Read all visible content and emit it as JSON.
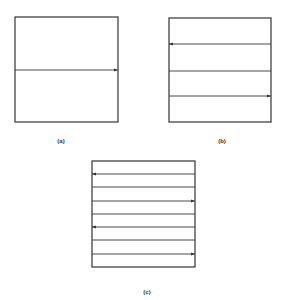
{
  "panels": [
    {
      "id": "a",
      "label": "(a)",
      "box": [
        15,
        17,
        103,
        105
      ],
      "lines": [
        {
          "y": 70,
          "arrow": "right"
        }
      ],
      "label_pos": [
        61,
        138
      ]
    },
    {
      "id": "b",
      "label": "(b)",
      "box": [
        169,
        18,
        102,
        104
      ],
      "lines": [
        {
          "y": 44,
          "arrow": "left"
        },
        {
          "y": 71,
          "arrow": "none"
        },
        {
          "y": 96,
          "arrow": "right"
        }
      ],
      "label_pos": [
        222,
        138
      ]
    },
    {
      "id": "c",
      "label": "(c)",
      "box": [
        92,
        161,
        103,
        106
      ],
      "lines": [
        {
          "y": 174,
          "arrow": "left"
        },
        {
          "y": 187,
          "arrow": "none"
        },
        {
          "y": 201,
          "arrow": "right"
        },
        {
          "y": 214,
          "arrow": "none"
        },
        {
          "y": 227,
          "arrow": "left"
        },
        {
          "y": 240,
          "arrow": "none"
        },
        {
          "y": 254,
          "arrow": "right"
        }
      ],
      "label_pos": [
        147,
        289
      ]
    }
  ],
  "colors": {
    "stroke": "#333333"
  }
}
